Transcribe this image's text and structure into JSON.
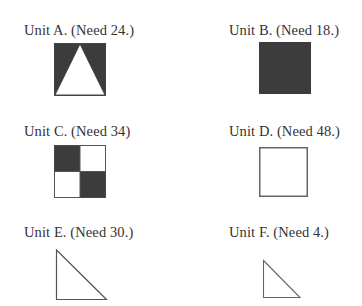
{
  "colors": {
    "dark_fill": "#3c3c3c",
    "stroke": "#555555",
    "text": "#333333"
  },
  "units": [
    {
      "id": "A",
      "label": "Unit A. (Need 24.)",
      "shape": "dark square with white isosceles triangle"
    },
    {
      "id": "B",
      "label": "Unit B. (Need 18.)",
      "shape": "solid dark square"
    },
    {
      "id": "C",
      "label": "Unit C. (Need 34)",
      "shape": "2x2 checkerboard square"
    },
    {
      "id": "D",
      "label": "Unit D. (Need 48.)",
      "shape": "outlined white square"
    },
    {
      "id": "E",
      "label": "Unit E. (Need 30.)",
      "shape": "outlined right triangle (large)"
    },
    {
      "id": "F",
      "label": "Unit F. (Need 4.)",
      "shape": "outlined right triangle (small)"
    }
  ]
}
